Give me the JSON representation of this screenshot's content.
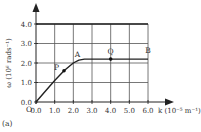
{
  "chart_data": {
    "type": "line",
    "title": "",
    "panel_label": "(a)",
    "xlabel": "k (10⁻⁵ m⁻¹)",
    "ylabel": "ω (10⁶ rads⁻¹)",
    "origin_label": "O",
    "xlim": [
      0,
      6.0
    ],
    "ylim": [
      0,
      4.0
    ],
    "x_ticks": [
      "0.0",
      "1.0",
      "2.0",
      "3.0",
      "4.0",
      "5.0",
      "6.0"
    ],
    "y_ticks": [
      "0.0",
      "1.0",
      "2.0",
      "3.0",
      "4.0"
    ],
    "grid": true,
    "series": [
      {
        "name": "dispersion curve",
        "x": [
          0.0,
          0.5,
          1.0,
          1.5,
          2.0,
          2.3,
          2.6,
          3.0,
          4.0,
          5.0,
          6.0
        ],
        "y": [
          0.0,
          0.55,
          1.1,
          1.6,
          2.0,
          2.15,
          2.2,
          2.2,
          2.2,
          2.2,
          2.2
        ]
      },
      {
        "name": "upper limit line",
        "x": [
          0.0,
          6.0
        ],
        "y": [
          4.0,
          4.0
        ]
      }
    ],
    "annotations": [
      {
        "label": "P",
        "x": 1.5,
        "y": 1.6,
        "marker": true
      },
      {
        "label": "A",
        "x": 2.0,
        "y": 2.0,
        "marker": false
      },
      {
        "label": "Q",
        "x": 4.0,
        "y": 2.2,
        "marker": true
      },
      {
        "label": "B",
        "x": 6.0,
        "y": 2.2,
        "marker": false
      }
    ]
  }
}
